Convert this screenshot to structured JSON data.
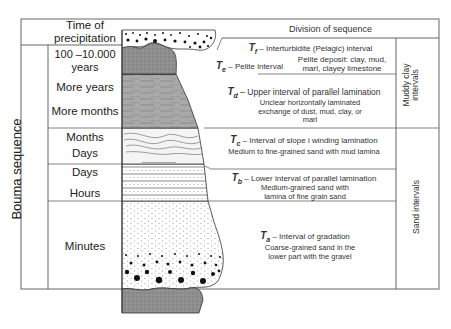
{
  "title": "Bouma sequence",
  "headers": {
    "time_column": "Time of precipitation",
    "division_column": "Division of sequence"
  },
  "time_rows": [
    {
      "label": "100 –10.000 years"
    },
    {
      "label": "More years"
    },
    {
      "label": "More months"
    },
    {
      "label": "Months"
    },
    {
      "label": "Days"
    },
    {
      "label": "Days"
    },
    {
      "label": "Hours"
    },
    {
      "label": "Minutes"
    }
  ],
  "intervals": [
    {
      "symbol": "T",
      "sub": "f",
      "name": "– Interturbidite (Pelagic) interval",
      "description": ""
    },
    {
      "symbol": "T",
      "sub": "e",
      "name": "– Pelite interval",
      "description": "Pelite  deposit: clay, mud, marl, clayey limestone"
    },
    {
      "symbol": "T",
      "sub": "d",
      "name": "– Upper interval of parallel lamination",
      "description": "Unclear horizontally laminated exchange of dust, mud, clay, or marl"
    },
    {
      "symbol": "T",
      "sub": "c",
      "name": "– Interval of slope i winding lamination",
      "description": "Medium to fine-grained sand with mud lamina"
    },
    {
      "symbol": "T",
      "sub": "b",
      "name": "– Lower interval of parallel lamination",
      "description": "Medium-grained sand with lamina of fine grain sand"
    },
    {
      "symbol": "T",
      "sub": "a",
      "name": "– Interval of gradation",
      "description": "Coarse-grained sand in the lower part with the gravel"
    }
  ],
  "groups": [
    {
      "label": "Muddy clay intervals"
    },
    {
      "label": "Sand intervals"
    }
  ],
  "colors": {
    "lines": "#666666",
    "mud_fill": "#8c8c8c",
    "lamina_fill": "#b5b5b5",
    "text": "#222222"
  }
}
